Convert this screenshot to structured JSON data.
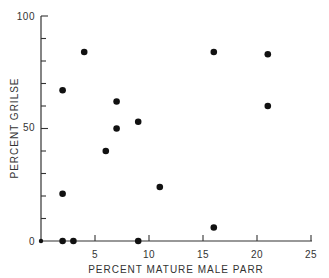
{
  "chart_data": {
    "type": "scatter",
    "title": "",
    "xlabel": "PERCENT MATURE MALE PARR",
    "ylabel": "PERCENT GRILSE",
    "xlim": [
      0,
      25
    ],
    "ylim": [
      0,
      100
    ],
    "xticks": [
      5,
      10,
      15,
      20,
      25
    ],
    "yticks_labeled": [
      0,
      50,
      100
    ],
    "yticks_minor": [
      10,
      20,
      30,
      40,
      60,
      70,
      80,
      90
    ],
    "grid": false,
    "legend": null,
    "points": [
      {
        "x": 0,
        "y": 0
      },
      {
        "x": 2,
        "y": 0
      },
      {
        "x": 3,
        "y": 0
      },
      {
        "x": 9,
        "y": 0
      },
      {
        "x": 2,
        "y": 21
      },
      {
        "x": 2,
        "y": 67
      },
      {
        "x": 4,
        "y": 84
      },
      {
        "x": 6,
        "y": 40
      },
      {
        "x": 7,
        "y": 50
      },
      {
        "x": 7,
        "y": 62
      },
      {
        "x": 9,
        "y": 53
      },
      {
        "x": 11,
        "y": 24
      },
      {
        "x": 16,
        "y": 84
      },
      {
        "x": 16,
        "y": 6
      },
      {
        "x": 21,
        "y": 83
      },
      {
        "x": 21,
        "y": 60
      }
    ]
  },
  "labels": {
    "x_title": "PERCENT MATURE MALE PARR",
    "y_title": "PERCENT GRILSE",
    "y100": "100",
    "y50": "50",
    "y0": "0",
    "x5": "5",
    "x10": "10",
    "x15": "15",
    "x20": "20",
    "x25": "25"
  }
}
